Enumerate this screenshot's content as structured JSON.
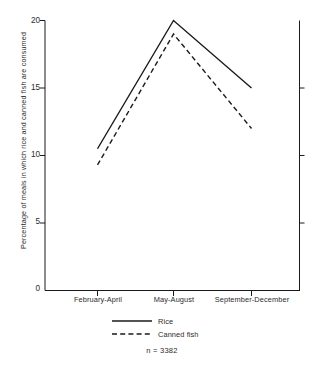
{
  "chart_data": {
    "type": "line",
    "title": "",
    "subtitle": "",
    "xlabel": "",
    "ylabel": "Percentage of meals in which rice and canned fish are consumed",
    "categories": [
      "February-April",
      "May-August",
      "September-December"
    ],
    "series": [
      {
        "name": "Rice",
        "style": "solid",
        "values": [
          10.5,
          20.0,
          15.0
        ]
      },
      {
        "name": "Canned fish",
        "style": "dashed",
        "values": [
          9.3,
          19.0,
          12.0
        ]
      }
    ],
    "ylim": [
      0,
      20
    ],
    "yticks": [
      0,
      5,
      10,
      15,
      20
    ],
    "ytick_labels": [
      "0",
      "5",
      "10",
      "15",
      "20"
    ],
    "grid": false,
    "legend_position": "bottom",
    "annotations": [
      "n = 3382"
    ],
    "line_color": "#1a1a1a"
  },
  "axis": {
    "y_tick_0": "0",
    "y_tick_1": "5",
    "y_tick_2": "10",
    "y_tick_3": "15",
    "y_tick_4": "20",
    "x_tick_0": "February-April",
    "x_tick_1": "May-August",
    "x_tick_2": "September-December",
    "ylabel": "Percentage of meals in which rice and canned fish are consumed"
  },
  "legend": {
    "item_rice": "Rice",
    "item_canned_fish": "Canned fish",
    "sample_size": "n = 3382"
  }
}
